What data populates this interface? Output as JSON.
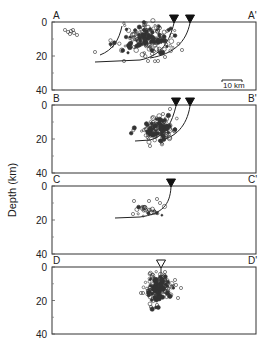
{
  "figure": {
    "ylabel": "Depth (km)",
    "scale_bar": {
      "label": "10 km",
      "panel": "A"
    },
    "y_ticks": [
      0,
      20,
      40
    ],
    "y_minor_ticks": [
      10,
      30
    ],
    "panels": [
      {
        "id": "A",
        "left_label": "A",
        "right_label": "A'",
        "box": {
          "x": 52,
          "y": 22,
          "w": 204,
          "h": 68
        },
        "stations": [
          {
            "x": 174,
            "type": "filled"
          },
          {
            "x": 190,
            "type": "filled"
          }
        ],
        "faults": [
          "M174,23 C170,40 162,56 140,60 L95,62",
          "M190,23 C186,42 174,54 150,58",
          "M122,26 C119,40 113,50 100,55"
        ],
        "cluster": {
          "cx": 148,
          "cy": 40,
          "rx": 22,
          "ry": 14,
          "n": 170
        },
        "extra_points": [
          [
            65,
            30
          ],
          [
            68,
            32
          ],
          [
            71,
            31
          ],
          [
            73,
            30
          ],
          [
            74,
            33
          ],
          [
            70,
            34
          ],
          [
            77,
            35
          ],
          [
            112,
            46
          ],
          [
            95,
            52
          ],
          [
            134,
            47
          ],
          [
            124,
            61
          ],
          [
            148,
            61
          ],
          [
            158,
            61
          ],
          [
            165,
            57
          ],
          [
            182,
            50
          ],
          [
            143,
            28
          ],
          [
            160,
            28
          ]
        ]
      },
      {
        "id": "B",
        "left_label": "B",
        "right_label": "B'",
        "box": {
          "x": 52,
          "y": 105,
          "w": 204,
          "h": 68
        },
        "stations": [
          {
            "x": 176,
            "type": "filled"
          },
          {
            "x": 190,
            "type": "filled"
          }
        ],
        "faults": [
          "M176,106 C172,122 166,136 150,140 L135,141",
          "M190,106 C187,126 175,138 160,140"
        ],
        "cluster": {
          "cx": 158,
          "cy": 129,
          "rx": 14,
          "ry": 11,
          "n": 150
        },
        "extra_points": [
          [
            163,
            114
          ],
          [
            170,
            109
          ],
          [
            160,
            120
          ],
          [
            150,
            146
          ]
        ]
      },
      {
        "id": "C",
        "left_label": "C",
        "right_label": "C'",
        "box": {
          "x": 52,
          "y": 186,
          "w": 204,
          "h": 68
        },
        "stations": [
          {
            "x": 171,
            "type": "filled"
          }
        ],
        "faults": [
          "M171,187 C170,205 162,214 140,217 L115,218"
        ],
        "cluster": {
          "cx": 148,
          "cy": 211,
          "rx": 12,
          "ry": 5,
          "n": 25
        },
        "extra_points": [
          [
            134,
            201
          ],
          [
            149,
            201
          ],
          [
            157,
            199
          ],
          [
            160,
            203
          ],
          [
            144,
            207
          ],
          [
            133,
            214
          ]
        ]
      },
      {
        "id": "D",
        "left_label": "D",
        "right_label": "D'",
        "box": {
          "x": 52,
          "y": 267,
          "w": 204,
          "h": 67
        },
        "stations": [
          {
            "x": 161,
            "type": "open"
          }
        ],
        "faults": [
          "M161,268 L161,290"
        ],
        "cluster": {
          "cx": 158,
          "cy": 288,
          "rx": 12,
          "ry": 12,
          "n": 170
        },
        "extra_points": [
          [
            141,
            293
          ],
          [
            143,
            293
          ],
          [
            175,
            280
          ],
          [
            176,
            285
          ],
          [
            181,
            288
          ],
          [
            178,
            298
          ],
          [
            151,
            307
          ],
          [
            157,
            305
          ],
          [
            165,
            272
          ]
        ]
      }
    ]
  }
}
